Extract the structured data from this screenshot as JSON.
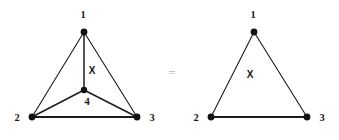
{
  "figure": {
    "background_color": "#ffffff",
    "ink_color": "#1c1c1c",
    "equals_color": "#b7b7b7",
    "relation_symbol": "=",
    "left_graph": {
      "name": "K4 planar drawing",
      "vertices": [
        {
          "id": "1",
          "label": "1",
          "x": 84,
          "y": 32,
          "label_x": 83,
          "label_y": 16,
          "radius": 3.4
        },
        {
          "id": "2",
          "label": "2",
          "x": 32,
          "y": 117,
          "label_x": 17,
          "label_y": 119,
          "radius": 3.4
        },
        {
          "id": "3",
          "label": "3",
          "x": 137,
          "y": 117,
          "label_x": 152,
          "label_y": 119,
          "radius": 3.4
        },
        {
          "id": "4",
          "label": "4",
          "x": 84,
          "y": 90,
          "label_x": 87,
          "label_y": 103,
          "radius": 3.2
        }
      ],
      "edges": [
        {
          "from": "1",
          "to": "2",
          "style": "thin"
        },
        {
          "from": "1",
          "to": "3",
          "style": "thin"
        },
        {
          "from": "2",
          "to": "3",
          "style": "base"
        },
        {
          "from": "1",
          "to": "4",
          "style": "spoke"
        },
        {
          "from": "2",
          "to": "4",
          "style": "spoke"
        },
        {
          "from": "3",
          "to": "4",
          "style": "spoke"
        }
      ],
      "face_labels": [
        {
          "text": "X",
          "x": 92,
          "y": 71
        }
      ]
    },
    "right_graph": {
      "name": "Triangle with face X",
      "vertices": [
        {
          "id": "1",
          "label": "1",
          "x": 254,
          "y": 32,
          "label_x": 253,
          "label_y": 16,
          "radius": 3.4
        },
        {
          "id": "2",
          "label": "2",
          "x": 211,
          "y": 117,
          "label_x": 196,
          "label_y": 119,
          "radius": 3.4
        },
        {
          "id": "3",
          "label": "3",
          "x": 307,
          "y": 117,
          "label_x": 322,
          "label_y": 119,
          "radius": 3.4
        }
      ],
      "edges": [
        {
          "from": "1",
          "to": "2",
          "style": "thin"
        },
        {
          "from": "1",
          "to": "3",
          "style": "thin"
        },
        {
          "from": "2",
          "to": "3",
          "style": "base"
        }
      ],
      "face_labels": [
        {
          "text": "X",
          "x": 250,
          "y": 75
        }
      ]
    },
    "relation": {
      "symbol": "=",
      "x": 172,
      "y": 74
    }
  }
}
